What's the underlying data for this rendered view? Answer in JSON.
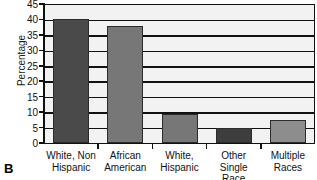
{
  "chart_data": {
    "type": "bar",
    "title": "",
    "panel_label": "B",
    "xlabel": "",
    "ylabel": "Percentage",
    "categories": [
      "White, Non Hispanic",
      "African American",
      "White, Hispanic",
      "Other Single Race",
      "Multiple Races"
    ],
    "category_lines": [
      [
        "White, Non",
        "Hispanic"
      ],
      [
        "African",
        "American"
      ],
      [
        "White,",
        "Hispanic"
      ],
      [
        "Other Single",
        "Race"
      ],
      [
        "Multiple",
        "Races"
      ]
    ],
    "values": [
      40,
      38,
      9.5,
      5,
      7.5
    ],
    "bar_colors": [
      "#4a4a4a",
      "#777777",
      "#777777",
      "#3d3d3d",
      "#8d8d8d"
    ],
    "ylim": [
      0,
      45
    ],
    "yticks": [
      0,
      5,
      10,
      15,
      20,
      25,
      30,
      35,
      40,
      45
    ],
    "ytick_labels": [
      "0",
      "5",
      "10",
      "15",
      "20",
      "25",
      "30",
      "35",
      "40",
      "45"
    ],
    "grid": true,
    "grid_axis": "y",
    "legend": "none",
    "plot_background": "#f2f2f2",
    "axis_color": "#111111"
  }
}
